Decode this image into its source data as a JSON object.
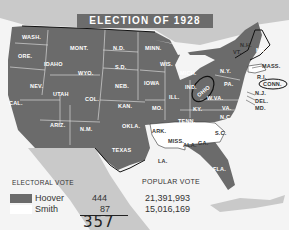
{
  "title": "ELECTION OF 1928",
  "colors": {
    "hoover": "#6b6b6b",
    "smith": "#ffffff",
    "background_land": "#c8c8c8",
    "water": "#f4f4f4",
    "title_box": "#6c6c6c"
  },
  "states_hoover": [
    "WASH.",
    "ORE.",
    "CAL.",
    "IDAHO",
    "NEV.",
    "MONT.",
    "WYO.",
    "UTAH",
    "ARIZ.",
    "COL.",
    "N.M.",
    "N.D.",
    "S.D.",
    "NEB.",
    "KAN.",
    "OKLA.",
    "TEXAS",
    "MINN.",
    "IOWA",
    "MO.",
    "WIS.",
    "ILL.",
    "MICH.",
    "IND.",
    "OHIO",
    "KY.",
    "TENN.",
    "W.VA.",
    "VA.",
    "N.C.",
    "PA.",
    "N.Y.",
    "VT.",
    "N.H.",
    "ME.",
    "N.J.",
    "DEL.",
    "MD.",
    "CONN.",
    "FLA."
  ],
  "states_smith": [
    "ARK.",
    "LA.",
    "MISS.",
    "ALA.",
    "GA.",
    "S.C.",
    "MASS.",
    "R.I."
  ],
  "map_labels": {
    "wash": "WASH.",
    "ore": "ORE.",
    "cal": "CAL.",
    "idaho": "IDAHO",
    "nev": "NEV.",
    "mont": "MONT.",
    "wyo": "WYO.",
    "utah": "UTAH",
    "ariz": "ARIZ.",
    "col": "COL.",
    "nm": "N.M.",
    "nd": "N.D.",
    "sd": "S.D.",
    "neb": "NEB.",
    "kan": "KAN.",
    "okla": "OKLA.",
    "texas": "TEXAS",
    "minn": "MINN.",
    "iowa": "IOWA",
    "mo": "MO.",
    "wis": "WIS.",
    "ill": "ILL.",
    "mich": "MICH.",
    "ind": "IND.",
    "ohio": "OHIO",
    "ky": "KY.",
    "tenn": "TENN.",
    "wva": "W.VA.",
    "va": "VA.",
    "nc": "N.C.",
    "pa": "PA.",
    "ny": "N.Y.",
    "vt": "VT.",
    "nh": "N.H.",
    "me": "ME.",
    "mass": "MASS.",
    "ri": "R.I.",
    "conn": "CONN.",
    "nj": "N.J.",
    "del": "DEL.",
    "md": "MD.",
    "ark": "ARK.",
    "la": "LA.",
    "miss": "MISS.",
    "ala": "ALA.",
    "ga": "GA.",
    "sc": "S.C.",
    "fla": "FLA."
  },
  "legend": {
    "electoral_heading": "ELECTORAL VOTE",
    "popular_heading": "POPULAR VOTE",
    "rows": [
      {
        "candidate": "Hoover",
        "electoral": "444",
        "popular": "21,391,993",
        "color": "#6b6b6b"
      },
      {
        "candidate": "Smith",
        "electoral": "87",
        "popular": "15,016,169",
        "color": "#ffffff"
      }
    ]
  },
  "annotations": {
    "handwritten_total": "357",
    "circled_states": [
      "OHIO",
      "CONN."
    ]
  }
}
